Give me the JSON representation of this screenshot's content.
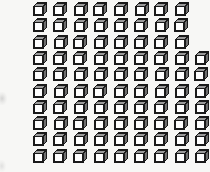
{
  "scene": {
    "title": "Cube grid pattern",
    "background_color": "#f7f7f5",
    "width": 210,
    "height": 172
  },
  "cube": {
    "icon_name": "cube-icon",
    "outline_color": "#1a1a1a",
    "front_face_color": "#ffffff",
    "top_face_color": "#9a9a9a",
    "side_face_color": "#6e6e6e",
    "size_px": 14
  },
  "grid": {
    "name": "cube-grid",
    "rows": 10,
    "row_start_y": 2,
    "row_step_y": 16.3,
    "col_start_x": 33,
    "col_step_x": 20.2,
    "counts_per_row": [
      8,
      8,
      8,
      9,
      9,
      9,
      9,
      9,
      9,
      9
    ],
    "total_cubes": 87,
    "row_x_offsets": [
      0,
      0,
      0,
      0,
      0,
      0,
      0,
      0,
      0,
      0
    ],
    "jitter": [
      [
        0.0,
        0.0,
        0.4,
        -0.3,
        0.2,
        0.5,
        -0.2,
        0.3
      ],
      [
        0.2,
        -0.3,
        0.1,
        0.4,
        -0.2,
        0.2,
        0.3,
        -0.1
      ],
      [
        -0.2,
        0.3,
        0.0,
        0.2,
        0.4,
        -0.3,
        0.1,
        0.2
      ],
      [
        0.1,
        0.2,
        -0.4,
        0.3,
        0.0,
        0.2,
        -0.1,
        0.3,
        0.2
      ],
      [
        0.3,
        -0.1,
        0.2,
        0.0,
        0.3,
        -0.2,
        0.4,
        0.1,
        -0.2
      ],
      [
        -0.1,
        0.4,
        0.1,
        -0.3,
        0.2,
        0.0,
        0.3,
        0.2,
        0.1
      ],
      [
        0.2,
        0.0,
        0.3,
        0.1,
        -0.2,
        0.4,
        0.0,
        0.3,
        -0.1
      ],
      [
        0.0,
        0.3,
        -0.2,
        0.2,
        0.4,
        0.1,
        0.2,
        -0.3,
        0.2
      ],
      [
        0.4,
        0.1,
        0.2,
        -0.1,
        0.0,
        0.3,
        0.2,
        0.1,
        0.3
      ],
      [
        0.1,
        0.2,
        0.0,
        0.3,
        -0.2,
        0.2,
        0.1,
        0.4,
        0.0
      ]
    ]
  },
  "edge_marks": [
    {
      "name": "edge-smudge-upper",
      "x": 0,
      "y": 92,
      "w": 7,
      "h": 13,
      "color": "#b8b8b8",
      "opacity": 0.55
    },
    {
      "name": "edge-smudge-lower",
      "x": 0,
      "y": 160,
      "w": 6,
      "h": 12,
      "color": "#c4c4c4",
      "opacity": 0.45
    }
  ]
}
